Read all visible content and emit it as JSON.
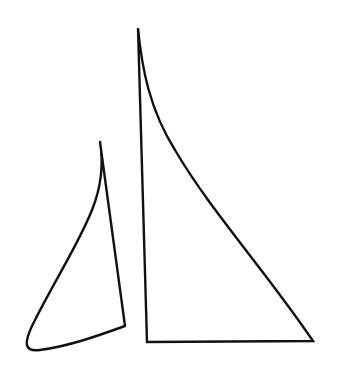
{
  "drawing": {
    "subject": "two sails",
    "stroke_color": "#111111",
    "background_color": "#ffffff",
    "shapes": [
      {
        "name": "small-sail",
        "description": "jib sail on the left"
      },
      {
        "name": "large-sail",
        "description": "mainsail on the right"
      }
    ]
  }
}
